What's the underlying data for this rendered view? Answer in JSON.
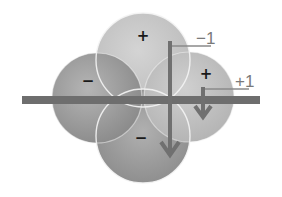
{
  "diagram": {
    "type": "orbital-lobes",
    "lobes": [
      {
        "position": "top",
        "sign": "+"
      },
      {
        "position": "left",
        "sign": "−"
      },
      {
        "position": "right",
        "sign": "+"
      },
      {
        "position": "bottom",
        "sign": "−"
      }
    ],
    "labels": {
      "minus_one": "−1",
      "plus_one": "+1"
    },
    "colors": {
      "lobe_light": "#c9c9c9",
      "lobe_dark": "#8e8e8e",
      "bar": "#6e6e6e",
      "arrow": "#707070",
      "outline": "#f4f4f4",
      "label": "#7a7a7a",
      "sign": "#1a1a1a"
    }
  }
}
